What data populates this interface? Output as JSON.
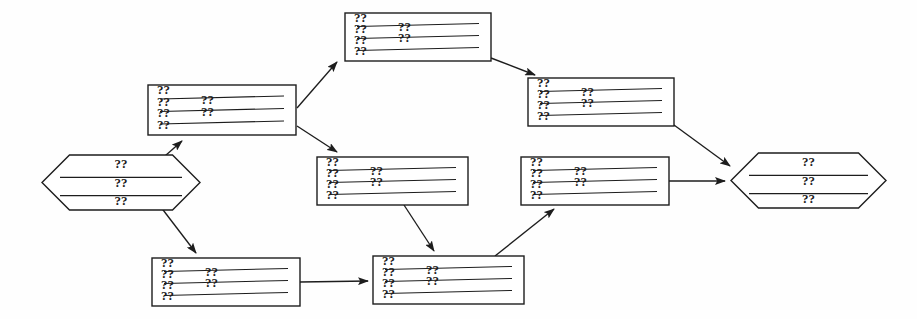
{
  "diagram": {
    "background_color": "#fefefe",
    "stroke_color": "#1d1d1d",
    "placeholder_glyph": "??",
    "nodes": [
      {
        "id": "start",
        "shape": "hexagon",
        "role": "terminator-start",
        "x": 42,
        "y": 155,
        "w": 158,
        "h": 55,
        "lines": [
          "??",
          "??",
          "??"
        ],
        "rules": 2
      },
      {
        "id": "b",
        "shape": "rectangle",
        "role": "process",
        "x": 148,
        "y": 85,
        "w": 148,
        "h": 50,
        "left_column": [
          "??",
          "??",
          "??",
          "??"
        ],
        "mid_column": [
          "??",
          "??"
        ],
        "rules": 3
      },
      {
        "id": "c",
        "shape": "rectangle",
        "role": "process",
        "x": 345,
        "y": 13,
        "w": 146,
        "h": 48,
        "left_column": [
          "??",
          "??",
          "??",
          "??"
        ],
        "mid_column": [
          "??",
          "??"
        ],
        "rules": 3
      },
      {
        "id": "d",
        "shape": "rectangle",
        "role": "process",
        "x": 528,
        "y": 78,
        "w": 146,
        "h": 48,
        "left_column": [
          "??",
          "??",
          "??",
          "??"
        ],
        "mid_column": [
          "??",
          "??"
        ],
        "rules": 3
      },
      {
        "id": "e",
        "shape": "rectangle",
        "role": "process",
        "x": 317,
        "y": 157,
        "w": 151,
        "h": 48,
        "left_column": [
          "??",
          "??",
          "??",
          "??"
        ],
        "mid_column": [
          "??",
          "??"
        ],
        "rules": 3
      },
      {
        "id": "f",
        "shape": "rectangle",
        "role": "process",
        "x": 521,
        "y": 157,
        "w": 148,
        "h": 48,
        "left_column": [
          "??",
          "??",
          "??",
          "??"
        ],
        "mid_column": [
          "??",
          "??"
        ],
        "rules": 3
      },
      {
        "id": "g",
        "shape": "rectangle",
        "role": "process",
        "x": 152,
        "y": 258,
        "w": 148,
        "h": 48,
        "left_column": [
          "??",
          "??",
          "??",
          "??"
        ],
        "mid_column": [
          "??",
          "??"
        ],
        "rules": 3
      },
      {
        "id": "h",
        "shape": "rectangle",
        "role": "process",
        "x": 373,
        "y": 256,
        "w": 151,
        "h": 48,
        "left_column": [
          "??",
          "??",
          "??",
          "??"
        ],
        "mid_column": [
          "??",
          "??"
        ],
        "rules": 3
      },
      {
        "id": "end",
        "shape": "hexagon",
        "role": "terminator-end",
        "x": 731,
        "y": 153,
        "w": 155,
        "h": 55,
        "lines": [
          "??",
          "??",
          "??"
        ],
        "rules": 2
      }
    ],
    "edges": [
      {
        "id": "start-b",
        "from": "start",
        "to": "b",
        "points": "157,163 182,141"
      },
      {
        "id": "start-g",
        "from": "start",
        "to": "g",
        "points": "157,202 196,253"
      },
      {
        "id": "b-c",
        "from": "b",
        "to": "c",
        "points": "297,108 337,62"
      },
      {
        "id": "b-e",
        "from": "b",
        "to": "e",
        "points": "297,126 337,152"
      },
      {
        "id": "c-d",
        "from": "c",
        "to": "d",
        "points": "491,58 535,75"
      },
      {
        "id": "e-h",
        "from": "e",
        "to": "h",
        "points": "404,205 434,251"
      },
      {
        "id": "g-h",
        "from": "g",
        "to": "h",
        "points": "300,282 368,281"
      },
      {
        "id": "h-f",
        "from": "h",
        "to": "f",
        "points": "495,256 554,209"
      },
      {
        "id": "d-end",
        "from": "d",
        "to": "end",
        "points": "674,125 730,166"
      },
      {
        "id": "f-end",
        "from": "f",
        "to": "end",
        "points": "669,181 725,181"
      }
    ]
  }
}
